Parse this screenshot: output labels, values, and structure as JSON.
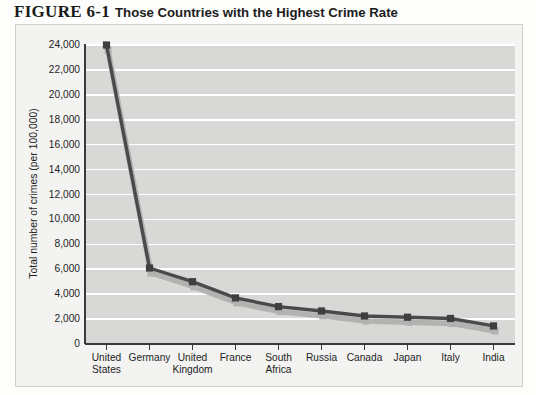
{
  "figure": {
    "number": "FIGURE 6-1",
    "caption": "Those Countries with the Highest Crime Rate"
  },
  "colors": {
    "frame_bg": "#f3f3f1",
    "frame_border": "#cfcfcb",
    "plot_bg": "#d8d8d6",
    "gridline": "#ffffff",
    "axis": "#3a3a3a",
    "series_line": "#4a4a4a",
    "series_marker": "#3f3f3f",
    "series_shadow": "#b2b2b0",
    "text": "#1e1e1e"
  },
  "chart_data": {
    "type": "line",
    "title": "Those Countries with the Highest Crime Rate",
    "xlabel": "",
    "ylabel": "Total number of crimes (per 100,000)",
    "ylim": [
      0,
      24000
    ],
    "ytick_step": 2000,
    "ytick_labels": [
      "0",
      "2,000",
      "4,000",
      "6,000",
      "8,000",
      "10,000",
      "12,000",
      "14,000",
      "16,000",
      "18,000",
      "20,000",
      "22,000",
      "24,000"
    ],
    "yticks": [
      0,
      2000,
      4000,
      6000,
      8000,
      10000,
      12000,
      14000,
      16000,
      18000,
      20000,
      22000,
      24000
    ],
    "grid": true,
    "grid_orientation": "horizontal",
    "legend": false,
    "legend_position": "none",
    "categories": [
      "United States",
      "Germany",
      "United Kingdom",
      "France",
      "South Africa",
      "Russia",
      "Canada",
      "Japan",
      "Italy",
      "India"
    ],
    "category_lines": [
      [
        "United",
        "States"
      ],
      [
        "Germany"
      ],
      [
        "United",
        "Kingdom"
      ],
      [
        "France"
      ],
      [
        "South",
        "Africa"
      ],
      [
        "Russia"
      ],
      [
        "Canada"
      ],
      [
        "Japan"
      ],
      [
        "Italy"
      ],
      [
        "India"
      ]
    ],
    "values": [
      24000,
      6100,
      5000,
      3700,
      3000,
      2650,
      2250,
      2150,
      2050,
      1450
    ],
    "marker": "square"
  }
}
